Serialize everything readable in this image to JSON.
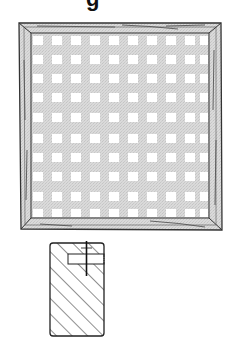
{
  "heading": {
    "visible_fragment": "g"
  },
  "frame_figure": {
    "description": "square wooden frame with lattice/grid panel",
    "grid_columns": 10,
    "grid_rows": 10,
    "colors": {
      "frame_fill": "#d6d6d6",
      "frame_stroke": "#333333",
      "panel_fill": "#d9d9d9",
      "grid_square": "#ffffff"
    }
  },
  "section_figure": {
    "description": "hatched cross-section of frame profile with rabbet slot",
    "colors": {
      "hatch": "#333333",
      "stroke": "#222222"
    }
  }
}
